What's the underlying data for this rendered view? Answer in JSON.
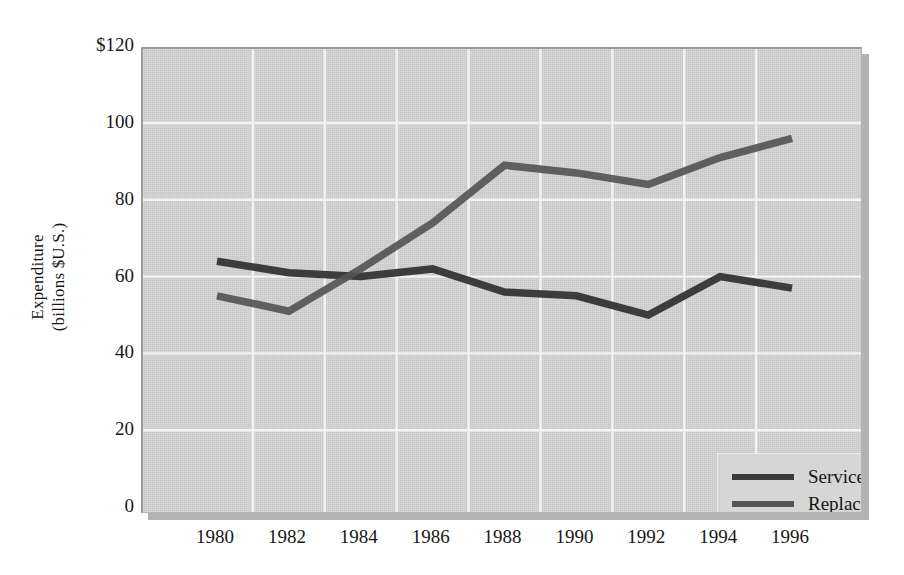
{
  "chart_data": {
    "type": "line",
    "title": "",
    "subtitle": "",
    "xlabel": "",
    "ylabel": "Expenditure\n(billions $U.S.)",
    "x": [
      1980,
      1982,
      1984,
      1986,
      1988,
      1990,
      1992,
      1994,
      1996
    ],
    "categories": [
      "1980",
      "1982",
      "1984",
      "1986",
      "1988",
      "1990",
      "1992",
      "1994",
      "1996"
    ],
    "series": [
      {
        "name": "Service/repair",
        "color": "#3c3c3c",
        "values": [
          64,
          61,
          60,
          62,
          56,
          55,
          50,
          60,
          57
        ]
      },
      {
        "name": "Replacement parts",
        "color": "#555555",
        "values": [
          55,
          51,
          62,
          74,
          89,
          87,
          84,
          91,
          96
        ]
      }
    ],
    "xlim": [
      1979,
      1997
    ],
    "ylim": [
      0,
      120
    ],
    "yticks": [
      0,
      20,
      40,
      60,
      80,
      100,
      120
    ],
    "ytick_labels": [
      "0",
      "20",
      "40",
      "60",
      "80",
      "100",
      "$120"
    ],
    "xticks": [
      1980,
      1982,
      1984,
      1986,
      1988,
      1990,
      1992,
      1994,
      1996
    ],
    "xtick_labels": [
      "1980",
      "1982",
      "1984",
      "1986",
      "1988",
      "1990",
      "1992",
      "1994",
      "1996"
    ],
    "grid": true,
    "grid_color": "#f2f2f2",
    "plot_background": "#d2d2d2",
    "legend_position": "lower right",
    "legend_entries": [
      "Service/repair",
      "Replacement parts"
    ]
  },
  "axis": {
    "y_title": "Expenditure\n(billions $U.S.)",
    "y_ticks": [
      {
        "label": "$120",
        "value": 120
      },
      {
        "label": "100",
        "value": 100
      },
      {
        "label": "80",
        "value": 80
      },
      {
        "label": "60",
        "value": 60
      },
      {
        "label": "40",
        "value": 40
      },
      {
        "label": "20",
        "value": 20
      },
      {
        "label": "0",
        "value": 0
      }
    ],
    "x_ticks": [
      {
        "label": "1980",
        "value": 1980
      },
      {
        "label": "1982",
        "value": 1982
      },
      {
        "label": "1984",
        "value": 1984
      },
      {
        "label": "1986",
        "value": 1986
      },
      {
        "label": "1988",
        "value": 1988
      },
      {
        "label": "1990",
        "value": 1990
      },
      {
        "label": "1992",
        "value": 1992
      },
      {
        "label": "1994",
        "value": 1994
      },
      {
        "label": "1996",
        "value": 1996
      }
    ]
  },
  "legend": {
    "items": [
      {
        "label": "Service/repair",
        "color": "#3c3c3c"
      },
      {
        "label": "Replacement parts",
        "color": "#555555"
      }
    ]
  }
}
